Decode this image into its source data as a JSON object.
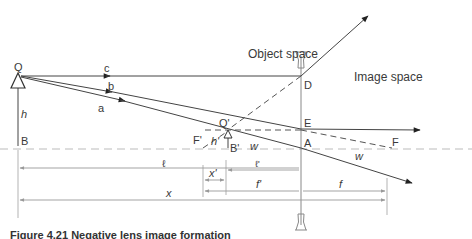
{
  "diagram": {
    "regions": {
      "object_space": "Object space",
      "image_space": "Image space"
    },
    "points": {
      "Q": "Q",
      "B": "B",
      "D": "D",
      "E": "E",
      "A": "A",
      "F": "F",
      "F_prime": "F'",
      "Q_prime": "Q'",
      "B_prime": "B'"
    },
    "rays": {
      "a": "a",
      "b": "b",
      "c": "c",
      "w_object": "w",
      "w_image": "w"
    },
    "heights": {
      "h": "h",
      "h_prime": "h'"
    },
    "dimensions": {
      "l": "ℓ",
      "l_prime": "ℓ'",
      "x_prime": "x'",
      "f_prime": "f'",
      "f": "f",
      "x": "x"
    },
    "caption": "Figure 4.21 Negative lens image formation"
  }
}
